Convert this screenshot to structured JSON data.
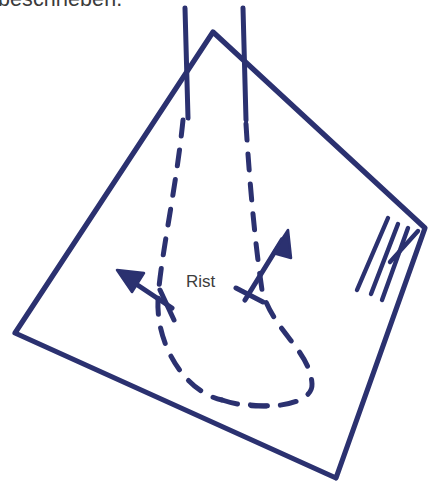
{
  "page": {
    "background_color": "#ffffff",
    "width": 444,
    "height": 496
  },
  "clipped_text": {
    "content": "beschrieben.",
    "color": "#3b3b3b",
    "note_clipped_top": true
  },
  "diagram": {
    "kind": "hand-drawn-sketch",
    "ink_color": "#2b3170",
    "stroke_width": 5,
    "labels": [
      {
        "name": "rist",
        "text": "Rist",
        "color": "#3d3d3d",
        "x": 186,
        "y": 272
      }
    ],
    "cloth_outline": {
      "name": "cloth-quadrilateral",
      "points": [
        [
          213,
          32
        ],
        [
          425,
          228
        ],
        [
          336,
          478
        ],
        [
          15,
          333
        ]
      ]
    },
    "peak_verticals": [
      {
        "name": "left-vertical",
        "x1": 185,
        "y1": 8,
        "x2": 188,
        "y2": 118
      },
      {
        "name": "right-vertical",
        "x1": 243,
        "y1": 8,
        "x2": 246,
        "y2": 120
      }
    ],
    "fringe_strokes": {
      "name": "fringe-hatching",
      "count": 4,
      "strokes": [
        [
          388,
          218,
          357,
          290
        ],
        [
          398,
          224,
          371,
          294
        ],
        [
          408,
          228,
          382,
          300
        ],
        [
          418,
          231,
          390,
          262
        ]
      ]
    },
    "dashed_foot_outline": {
      "name": "foot-outline-dashed",
      "dash_pattern": "16 14",
      "left_edge": "M 183 120 C 176 190, 160 260, 158 300 C 156 345, 185 392, 222 400",
      "right_edge": "M 246 124 C 250 190, 256 250, 262 290 C 272 330, 310 350, 312 384 C 313 402, 278 410, 245 404",
      "toe_curve": "M 222 400 C 240 406, 262 408, 280 404"
    },
    "arrows": [
      {
        "name": "left-arrow",
        "direction": "up-left",
        "shaft": [
          172,
          308,
          122,
          274
        ],
        "tip": [
          118,
          271
        ],
        "head_points": "118,271 142,272 133,290",
        "cross_tick": [
          160,
          292,
          172,
          318
        ]
      },
      {
        "name": "right-arrow",
        "direction": "up-right",
        "shaft": [
          245,
          298,
          283,
          236
        ],
        "tip": [
          286,
          232
        ],
        "head_points": "286,232 272,251 290,256",
        "cross_tick": [
          236,
          288,
          262,
          300
        ]
      }
    ]
  }
}
